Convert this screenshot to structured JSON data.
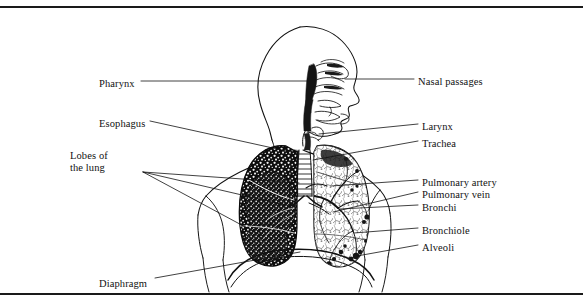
{
  "figure": {
    "ink_color": "#111111",
    "background_color": "#ffffff",
    "rule_color": "#1a1a1a"
  },
  "labels_left": [
    {
      "id": "pharynx",
      "text": "Pharynx",
      "x": 99,
      "y": 78
    },
    {
      "id": "esophagus",
      "text": "Esophagus",
      "x": 99,
      "y": 118
    },
    {
      "id": "lobes-line1",
      "text": "Lobes of",
      "x": 70,
      "y": 150
    },
    {
      "id": "lobes-line2",
      "text": "the lung",
      "x": 70,
      "y": 162
    },
    {
      "id": "diaphragm",
      "text": "Diaphragm",
      "x": 99,
      "y": 278
    }
  ],
  "labels_right": [
    {
      "id": "nasal-passages",
      "text": "Nasal passages",
      "x": 418,
      "y": 76
    },
    {
      "id": "larynx",
      "text": "Larynx",
      "x": 422,
      "y": 121
    },
    {
      "id": "trachea",
      "text": "Trachea",
      "x": 422,
      "y": 138
    },
    {
      "id": "pulmonary-artery",
      "text": "Pulmonary artery",
      "x": 422,
      "y": 177
    },
    {
      "id": "pulmonary-vein",
      "text": "Pulmonary vein",
      "x": 422,
      "y": 189
    },
    {
      "id": "bronchi",
      "text": "Bronchi",
      "x": 422,
      "y": 202
    },
    {
      "id": "bronchiole",
      "text": "Bronchiole",
      "x": 422,
      "y": 225
    },
    {
      "id": "alveoli",
      "text": "Alveoli",
      "x": 422,
      "y": 242
    }
  ],
  "anatomy_parts": [
    "nasal passages",
    "pharynx",
    "larynx",
    "trachea",
    "esophagus",
    "bronchi",
    "bronchiole",
    "alveoli",
    "pulmonary artery",
    "pulmonary vein",
    "lobes of the lung",
    "diaphragm"
  ]
}
